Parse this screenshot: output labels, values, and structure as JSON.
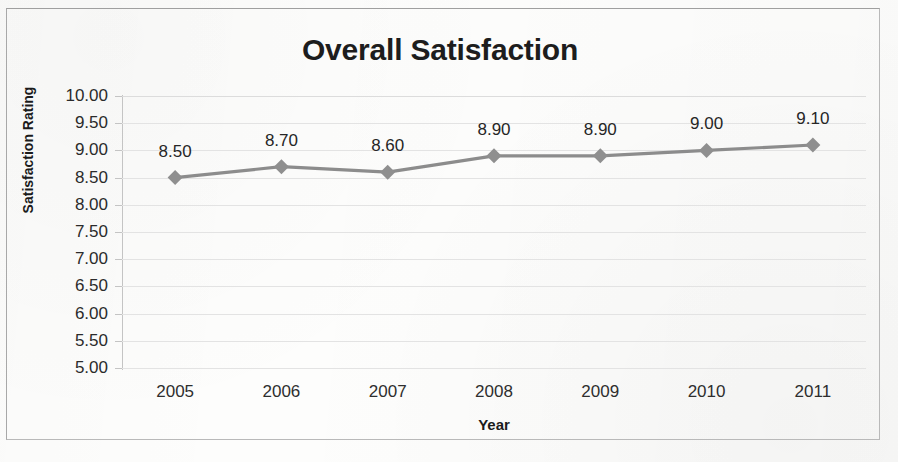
{
  "chart_data": {
    "type": "line",
    "title": "Overall Satisfaction",
    "xlabel": "Year",
    "ylabel": "Satisfaction Rating",
    "categories": [
      "2005",
      "2006",
      "2007",
      "2008",
      "2009",
      "2010",
      "2011"
    ],
    "values": [
      8.5,
      8.7,
      8.6,
      8.9,
      8.9,
      9.0,
      9.1
    ],
    "data_labels": [
      "8.50",
      "8.70",
      "8.60",
      "8.90",
      "8.90",
      "9.00",
      "9.10"
    ],
    "ylim": [
      5.0,
      10.0
    ],
    "ytick_step": 0.5,
    "ytick_labels": [
      "10.00",
      "9.50",
      "9.00",
      "8.50",
      "8.00",
      "7.50",
      "7.00",
      "6.50",
      "6.00",
      "5.50",
      "5.00"
    ],
    "grid": true,
    "grid_axis": "y",
    "legend": false,
    "marker": "diamond",
    "series_color": "#8c8c8c",
    "marker_color": "#8f8f8f",
    "gridline_color": "#dcdcdc",
    "axis_color": "#c4c4c4",
    "text_color": "#262626",
    "title_color": "#1d1d1d",
    "background_color": "#fdfdfc",
    "border_color": "#b9b9b9"
  }
}
